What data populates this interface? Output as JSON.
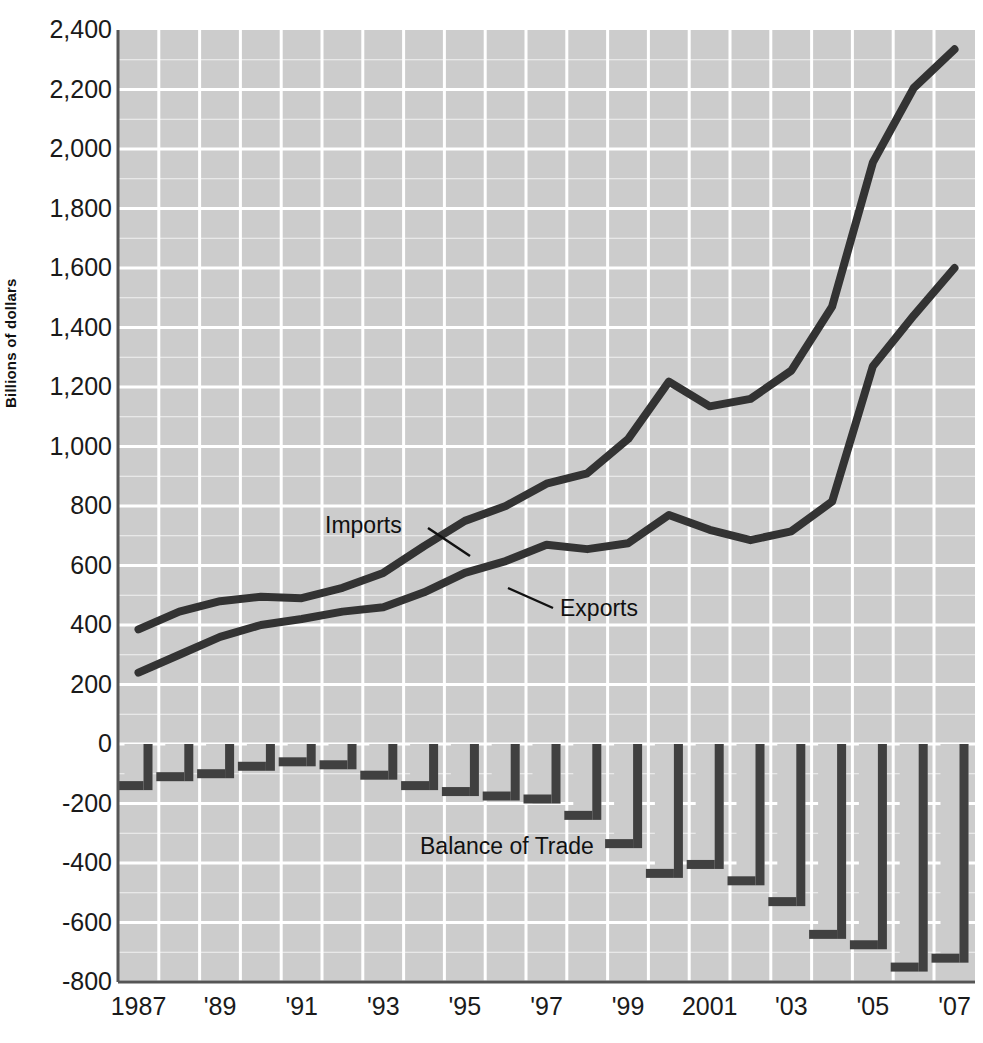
{
  "chart_data": {
    "type": "line",
    "title": "",
    "subtitle": "",
    "xlabel": "",
    "ylabel": "Billions of dollars",
    "xlim": [
      1987,
      2007
    ],
    "ylim": [
      -800,
      2400
    ],
    "ytick_step": 200,
    "grid": true,
    "grid_color": "#ffffff",
    "plot_background": "#cccccc",
    "series_color": "#333333",
    "legend_position": "inline-annotations",
    "x": [
      1987,
      1988,
      1989,
      1990,
      1991,
      1992,
      1993,
      1994,
      1995,
      1996,
      1997,
      1998,
      1999,
      2000,
      2001,
      2002,
      2003,
      2004,
      2005,
      2006,
      2007
    ],
    "xtick_labels": [
      "1987",
      "'89",
      "'91",
      "'93",
      "'95",
      "'97",
      "'99",
      "2001",
      "'03",
      "'05",
      "'07"
    ],
    "xtick_values": [
      1987,
      1989,
      1991,
      1993,
      1995,
      1997,
      1999,
      2001,
      2003,
      2005,
      2007
    ],
    "ytick_labels": [
      "2,400",
      "2,200",
      "2,000",
      "1,800",
      "1,600",
      "1,400",
      "1,200",
      "1,000",
      "800",
      "600",
      "400",
      "200",
      "0",
      "-200",
      "-400",
      "-600",
      "-800"
    ],
    "ytick_values": [
      2400,
      2200,
      2000,
      1800,
      1600,
      1400,
      1200,
      1000,
      800,
      600,
      400,
      200,
      0,
      -200,
      -400,
      -600,
      -800
    ],
    "series": [
      {
        "name": "Imports",
        "type": "line",
        "label_text": "Imports",
        "values": [
          385,
          445,
          480,
          495,
          490,
          525,
          575,
          665,
          750,
          800,
          875,
          910,
          1025,
          1218,
          1135,
          1160,
          1255,
          1470,
          1955,
          2205,
          2335
        ]
      },
      {
        "name": "Exports",
        "type": "line",
        "label_text": "Exports",
        "values": [
          240,
          300,
          360,
          400,
          420,
          445,
          460,
          510,
          575,
          615,
          670,
          655,
          675,
          770,
          720,
          685,
          715,
          815,
          1270,
          1440,
          1600
        ]
      },
      {
        "name": "Balance of Trade",
        "type": "bar",
        "label_text": "Balance of Trade",
        "values": [
          -155,
          -125,
          -115,
          -90,
          -75,
          -85,
          -120,
          -155,
          -175,
          -190,
          -200,
          -255,
          -350,
          -450,
          -420,
          -475,
          -545,
          -655,
          -690,
          -765,
          -735
        ]
      }
    ],
    "annotations": [
      {
        "text": "Imports",
        "x_px": 325,
        "y_px": 513,
        "leader_to_x_px": 468,
        "leader_to_y_px": 554
      },
      {
        "text": "Exports",
        "x_px": 514,
        "y_px": 572,
        "leader_to_x_px": 505,
        "leader_to_y_px": 558
      },
      {
        "text": "Balance of Trade",
        "x_px": 420,
        "y_px": 835
      }
    ]
  },
  "axis": {
    "y_title": "Billions of dollars",
    "y_ticks": [
      "2,400",
      "2,200",
      "2,000",
      "1,800",
      "1,600",
      "1,400",
      "1,200",
      "1,000",
      "800",
      "600",
      "400",
      "200",
      "0",
      "-200",
      "-400",
      "-600",
      "-800"
    ],
    "x_ticks": [
      "1987",
      "'89",
      "'91",
      "'93",
      "'95",
      "'97",
      "'99",
      "2001",
      "'03",
      "'05",
      "'07"
    ]
  },
  "labels": {
    "imports": "Imports",
    "exports": "Exports",
    "balance_of_trade": "Balance of Trade"
  },
  "colors": {
    "plot_bg": "#cccccc",
    "grid": "#ffffff",
    "line": "#333333",
    "bar_edge": "#404040",
    "axis": "#555555",
    "text": "#1a1a1a"
  }
}
